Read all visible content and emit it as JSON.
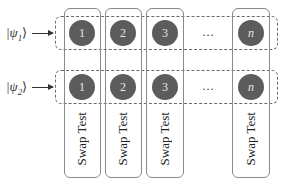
{
  "diagram": {
    "inputs": [
      {
        "label_prefix": "|ψ",
        "label_sub": "1",
        "label_suffix": "⟩"
      },
      {
        "label_prefix": "|ψ",
        "label_sub": "2",
        "label_suffix": "⟩"
      }
    ],
    "columns": [
      {
        "index": "1",
        "label": "Swap Test"
      },
      {
        "index": "2",
        "label": "Swap Test"
      },
      {
        "index": "3",
        "label": "Swap Test"
      },
      {
        "index": "n",
        "label": "Swap Test"
      }
    ],
    "ellipsis": "…",
    "colors": {
      "circle_fill": "#5c5c5c",
      "circle_text": "#e8e8e8",
      "column_border": "#8a8a8a",
      "row_border": "#6a6a6a"
    }
  }
}
